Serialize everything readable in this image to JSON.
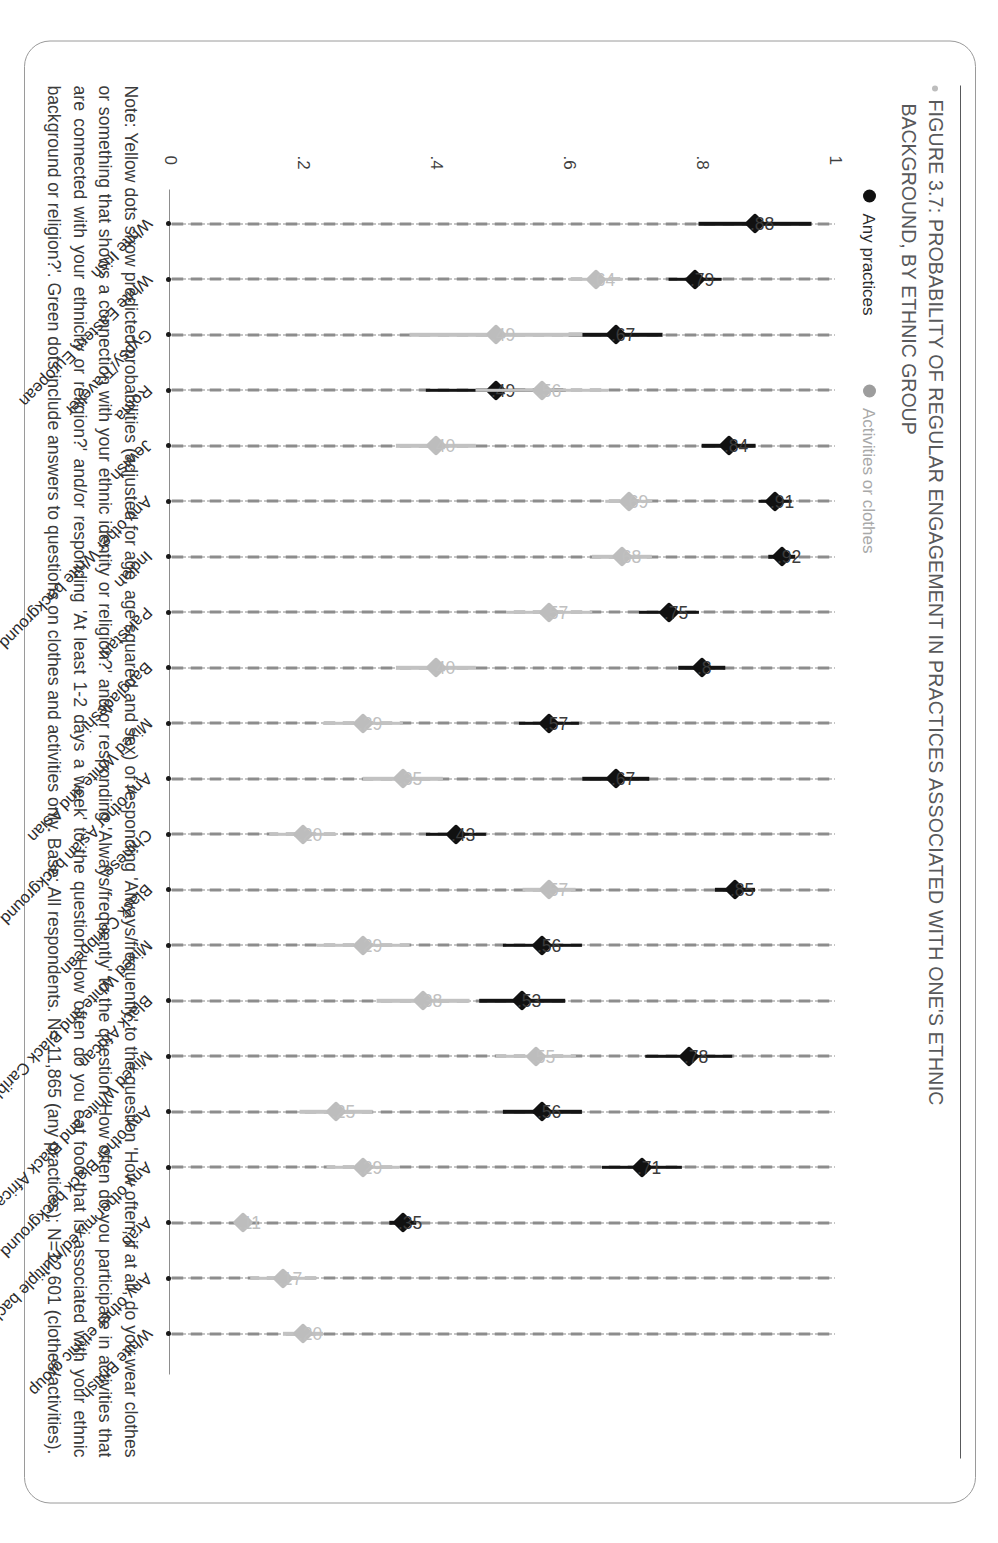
{
  "figure": {
    "bullet_icon": "bullet-dot",
    "title_line1": "FIGURE 3.7: PROBABILITY OF REGULAR ENGAGEMENT IN PRACTICES ASSOCIATED WITH ONE'S ETHNIC",
    "title_line2": "BACKGROUND, BY ETHNIC GROUP"
  },
  "legend": {
    "items": [
      {
        "label": "Any practices",
        "color": "#111111",
        "icon": "legend-dot-dark"
      },
      {
        "label": "Activities or clothes",
        "color": "#9d9d9d",
        "icon": "legend-dot-light"
      }
    ]
  },
  "note": {
    "text": "Note: Yellow dots show predicted probabilities (adjusted for age, age squared and sex) of responding 'Always/frequently' to the question 'How often, if at all, do you wear clothes or something that shows a connection with your ethnic identity or religion?' and/or responding 'Always/frequently' to the question 'How often do you participate in activities that are connected with your ethnicity or religion?' and/or responding 'At least 1-2 days a week' to the question 'How often do you eat food that is associated with your ethnic background or religion?'. Green dots include answers to questions on clothes and activities only. Base: All respondents. N= 11,865 (any practices); N=12,601 (clothes/activities)."
  },
  "chart_data": {
    "type": "scatter",
    "title": "FIGURE 3.7: PROBABILITY OF REGULAR ENGAGEMENT IN PRACTICES ASSOCIATED WITH ONE'S ETHNIC BACKGROUND, BY ETHNIC GROUP",
    "xlabel": "",
    "ylabel": "",
    "ylim": [
      0,
      1
    ],
    "yticks": [
      "0",
      ".2",
      ".4",
      ".6",
      ".8",
      "1"
    ],
    "grid": "dotted vertical gridlines at each y tick",
    "legend_position": "top-left",
    "categories": [
      "White Irish",
      "White Eastern European",
      "Gypsy/Traveller",
      "Roma",
      "Jewish",
      "Any other White background",
      "Indian",
      "Pakistani",
      "Bangladeshi",
      "Mixed White and Asian",
      "Any other Asian background",
      "Chinese",
      "Black Caribbean",
      "Mixed White and Black Caribbean",
      "Black African",
      "Mixed White and Black African",
      "Any other Black background",
      "Any other mixed/multiple background",
      "Arab",
      "Any other ethnic group",
      "White British"
    ],
    "series": [
      {
        "name": "Any practices",
        "color": "#111111",
        "values": [
          0.88,
          0.79,
          0.67,
          0.49,
          0.84,
          0.91,
          0.92,
          0.75,
          0.8,
          0.57,
          0.67,
          0.43,
          0.85,
          0.56,
          0.53,
          0.78,
          0.56,
          0.71,
          0.35,
          null,
          null
        ],
        "labels": [
          ".88",
          ".79",
          ".67",
          ".49",
          ".84",
          ".91",
          ".92",
          ".75",
          ".8",
          ".57",
          ".67",
          ".43",
          ".85",
          ".56",
          ".53",
          ".78",
          ".56",
          ".71",
          ".35",
          null,
          null
        ],
        "ci_low": [
          0.76,
          0.75,
          0.6,
          0.39,
          0.8,
          0.88,
          0.9,
          0.71,
          0.77,
          0.53,
          0.62,
          0.39,
          0.82,
          0.5,
          0.47,
          0.71,
          0.5,
          0.65,
          0.33,
          null,
          null
        ],
        "ci_high": [
          0.93,
          0.83,
          0.74,
          0.6,
          0.88,
          0.93,
          0.94,
          0.8,
          0.84,
          0.62,
          0.72,
          0.48,
          0.88,
          0.62,
          0.6,
          0.84,
          0.62,
          0.77,
          0.37,
          null,
          null
        ]
      },
      {
        "name": "Activities or clothes",
        "color": "#bdbdbd",
        "values": [
          null,
          0.64,
          0.49,
          0.56,
          0.4,
          0.69,
          0.68,
          0.57,
          0.4,
          0.29,
          0.35,
          0.2,
          0.57,
          0.29,
          0.38,
          0.55,
          0.25,
          0.29,
          0.11,
          0.17,
          0.2
        ],
        "labels": [
          null,
          ".64",
          ".49",
          ".56",
          ".40",
          ".69",
          ".68",
          ".57",
          ".40",
          ".29",
          ".35",
          ".20",
          ".57",
          ".29",
          ".38",
          ".55",
          ".25",
          ".29",
          ".11",
          ".17",
          ".20"
        ],
        "ci_low": [
          null,
          0.6,
          0.36,
          0.45,
          0.34,
          0.65,
          0.63,
          0.5,
          0.34,
          0.23,
          0.29,
          0.15,
          0.53,
          0.22,
          0.31,
          0.49,
          0.2,
          0.24,
          0.1,
          0.12,
          0.17
        ],
        "ci_high": [
          null,
          0.68,
          0.62,
          0.65,
          0.46,
          0.72,
          0.72,
          0.63,
          0.46,
          0.35,
          0.41,
          0.25,
          0.61,
          0.36,
          0.45,
          0.61,
          0.31,
          0.35,
          0.12,
          0.22,
          0.23
        ]
      }
    ]
  }
}
